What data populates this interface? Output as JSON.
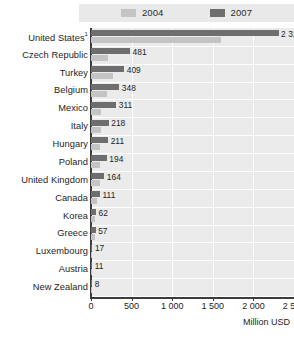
{
  "legend": {
    "entries": [
      {
        "label": "2004",
        "color": "#c4c4c4",
        "icon": "legend-swatch"
      },
      {
        "label": "2007",
        "color": "#6e6e6e",
        "icon": "legend-swatch"
      }
    ]
  },
  "axis": {
    "title": "Million USD",
    "ticks": [
      "0",
      "500",
      "1 000",
      "1 500",
      "2 000",
      "2 500"
    ]
  },
  "chart_data": {
    "type": "bar",
    "orientation": "horizontal",
    "title": "",
    "xlabel": "Million USD",
    "ylabel": "",
    "xlim": [
      0,
      2500
    ],
    "grid": true,
    "legend_position": "top",
    "categories": [
      "United States¹",
      "Czech Republic",
      "Turkey",
      "Belgium",
      "Mexico",
      "Italy",
      "Hungary",
      "Poland",
      "United Kingdom",
      "Canada",
      "Korea",
      "Greece",
      "Luxembourg",
      "Austria",
      "New Zealand"
    ],
    "series": [
      {
        "name": "2007",
        "color": "#6e6e6e",
        "values": [
          2310,
          481,
          409,
          348,
          311,
          218,
          211,
          194,
          164,
          111,
          62,
          57,
          17,
          11,
          8
        ],
        "labels": [
          "2 310",
          "481",
          "409",
          "348",
          "311",
          "218",
          "211",
          "194",
          "164",
          "111",
          "62",
          "57",
          "17",
          "11",
          "8"
        ]
      },
      {
        "name": "2004",
        "color": "#c4c4c4",
        "values": [
          1600,
          215,
          265,
          195,
          120,
          120,
          115,
          105,
          105,
          70,
          48,
          46,
          9,
          7,
          5
        ],
        "labels": [
          "",
          "",
          "",
          "",
          "",
          "",
          "",
          "",
          "",
          "",
          "",
          "",
          "",
          "",
          ""
        ]
      }
    ]
  },
  "colors": {
    "plot_background": "#ebebeb",
    "legend_background": "#e9e9e9",
    "gridline": "#ffffff",
    "axis": "#3c3c3c",
    "text": "#1e1e1e"
  }
}
